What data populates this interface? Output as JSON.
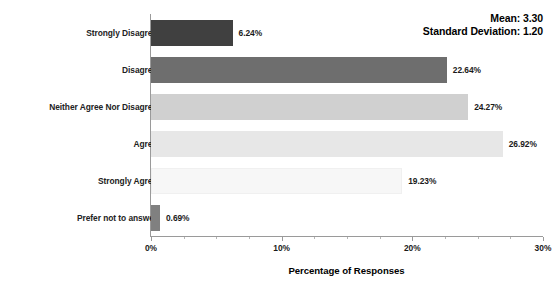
{
  "chart_data": {
    "type": "bar",
    "orientation": "horizontal",
    "title": "",
    "xlabel": "Percentage of Responses",
    "ylabel": "",
    "xlim": [
      0,
      30
    ],
    "xtick_labels": [
      "0%",
      "10%",
      "20%",
      "30%"
    ],
    "xtick_values": [
      0,
      10,
      20,
      30
    ],
    "xtick_minor_values": [
      2.5,
      5,
      7.5,
      12.5,
      15,
      17.5,
      22.5,
      25,
      27.5
    ],
    "grid": false,
    "legend": "none",
    "categories": [
      "Strongly Disagree",
      "Disagree",
      "Neither Agree Nor Disagree",
      "Agree",
      "Strongly Agree",
      "Prefer not to answer"
    ],
    "values": [
      6.24,
      22.64,
      24.27,
      26.92,
      19.23,
      0.69
    ],
    "value_labels": [
      "6.24%",
      "22.64%",
      "24.27%",
      "26.92%",
      "19.23%",
      "0.69%"
    ],
    "bar_colors": [
      "#404040",
      "#6e6e6e",
      "#d0d0d0",
      "#e7e7e7",
      "#f7f7f7",
      "#808080"
    ],
    "annotations": [
      "Mean: 3.30",
      "Standard Deviation: 1.20"
    ]
  },
  "statistics": {
    "mean_label": "Mean: 3.30",
    "std_label": "Standard Deviation: 1.20"
  },
  "axis": {
    "title": "Percentage of Responses"
  }
}
